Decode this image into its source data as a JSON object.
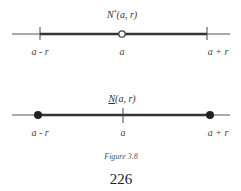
{
  "figure": {
    "top": {
      "title": "N*(a, r)",
      "title_main": "N",
      "title_sup": "*",
      "title_rest": "(a, r)",
      "labels": {
        "left": "a - r",
        "center": "a",
        "right": "a + r"
      },
      "center_marker": "open-circle",
      "endpoint_markers": "ticks"
    },
    "bottom": {
      "title": "N(a, r)",
      "title_main": "N",
      "title_rest": "(a, r)",
      "labels": {
        "left": "a - r",
        "center": "a",
        "right": "a + r"
      },
      "center_marker": "tick",
      "endpoint_markers": "filled-dots"
    },
    "caption": "Figure 3.8"
  },
  "page_number": "226"
}
